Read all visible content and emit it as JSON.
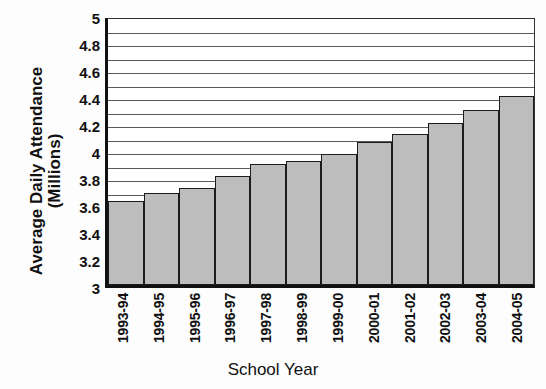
{
  "chart_data": {
    "type": "bar",
    "title": "",
    "xlabel": "School Year",
    "ylabel": "Average Daily Attendance (Millions)",
    "ylabel_line1": "Average Daily Attendance",
    "ylabel_line2": "(Millions)",
    "ylim": [
      3,
      5
    ],
    "ytick_step": 0.2,
    "gridline_step": 0.1,
    "grid": true,
    "legend": "none",
    "ytick_labels": [
      "5",
      "4.8",
      "4.6",
      "4.4",
      "4.2",
      "4",
      "3.8",
      "3.6",
      "3.4",
      "3.2",
      "3"
    ],
    "ytick_values": [
      5,
      4.8,
      4.6,
      4.4,
      4.2,
      4,
      3.8,
      3.6,
      3.4,
      3.2,
      3
    ],
    "categories": [
      "1993-94",
      "1994-95",
      "1995-96",
      "1996-97",
      "1997-98",
      "1998-99",
      "1999-00",
      "2000-01",
      "2001-02",
      "2002-03",
      "2003-04",
      "2004-05"
    ],
    "values": [
      3.62,
      3.68,
      3.72,
      3.81,
      3.9,
      3.92,
      3.97,
      4.06,
      4.12,
      4.2,
      4.3,
      4.4
    ],
    "bar_fill": "#bdbdbd",
    "bar_edge": "#1c1c1c",
    "axis_color": "#111111",
    "grid_color": "#5a5a5a",
    "background": "#ffffff"
  },
  "figure": {
    "clipped_title_fragment": ""
  }
}
